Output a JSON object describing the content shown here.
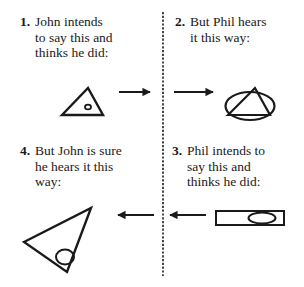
{
  "panels": [
    {
      "number": "1.",
      "lines": [
        "John intends",
        "to say this and",
        "thinks he did:"
      ],
      "shape": "triangle-with-small-circle"
    },
    {
      "number": "2.",
      "lines": [
        "But Phil hears",
        "it this way:"
      ],
      "shape": "ellipse-with-inscribed-triangle"
    },
    {
      "number": "3.",
      "lines": [
        "Phil intends to",
        "say this and",
        "thinks he did:"
      ],
      "shape": "rectangle-with-ellipse"
    },
    {
      "number": "4.",
      "lines": [
        "But John is sure",
        "he hears it this",
        "way:"
      ],
      "shape": "rotated-triangle-with-circle"
    }
  ],
  "arrows": [
    {
      "from": "panel-1",
      "to": "divider",
      "direction": "right"
    },
    {
      "from": "divider",
      "to": "panel-2",
      "direction": "right"
    },
    {
      "from": "panel-3",
      "to": "divider",
      "direction": "left"
    },
    {
      "from": "divider",
      "to": "panel-4",
      "direction": "left"
    }
  ],
  "colors": {
    "ink": "#1a1a1a",
    "background": "#ffffff"
  }
}
